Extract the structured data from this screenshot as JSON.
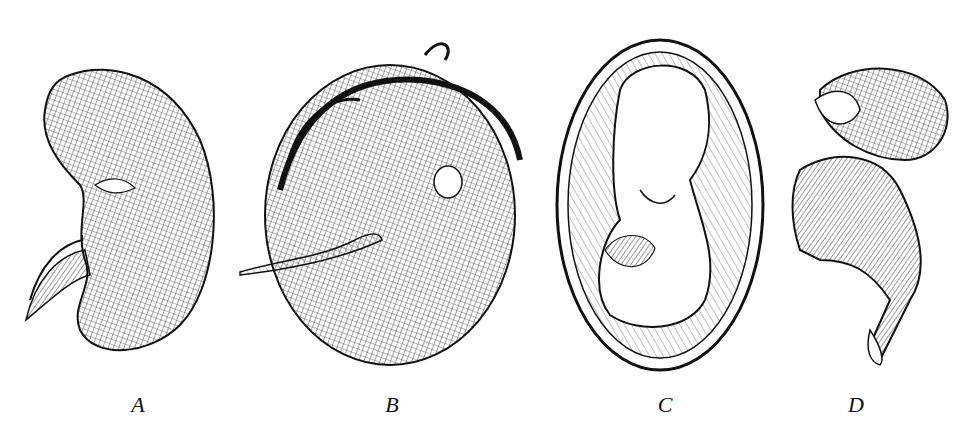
{
  "figure": {
    "panels": [
      {
        "id": "A",
        "label": "A",
        "x": 138,
        "description": "kidney-shaped mass with trailing cord"
      },
      {
        "id": "B",
        "label": "B",
        "x": 392,
        "description": "round mass with hair and trailing cord"
      },
      {
        "id": "C",
        "label": "C",
        "x": 665,
        "description": "fetus curled within oval sac"
      },
      {
        "id": "D",
        "label": "D",
        "x": 856,
        "description": "skeletal fetal remains"
      }
    ]
  }
}
